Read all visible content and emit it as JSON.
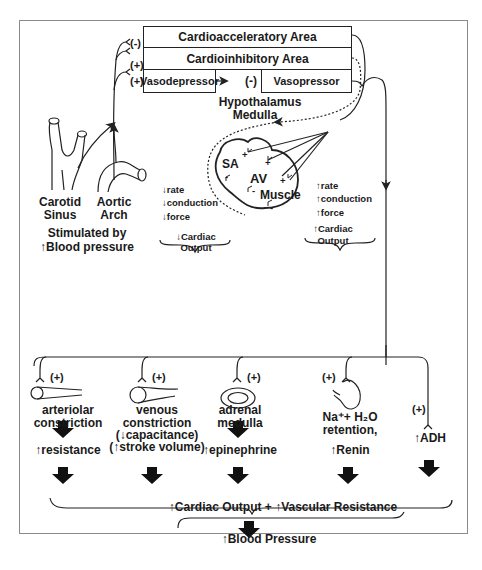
{
  "frame": {
    "border_color": "#8a8a8a",
    "line_color": "#222222"
  },
  "cns": {
    "boxes": {
      "cardioacceleratory": "Cardioacceleratory Area",
      "cardioinhibitory": "Cardioinhibitory Area",
      "vasodepressor": "Vasodepressor",
      "vasopressor": "Vasopressor"
    },
    "signs": {
      "cardioacceleratory": "(-)",
      "cardioinhibitory": "(+)",
      "vasodepressor": "(+)",
      "vasopressor": "(-)"
    },
    "label_line1": "Hypothalamus",
    "label_line2": "Medulla"
  },
  "receptors": {
    "carotid_line1": "Carotid",
    "carotid_line2": "Sinus",
    "aortic_line1": "Aortic",
    "aortic_line2": "Arch",
    "stimulated_line1": "Stimulated by",
    "stimulated_line2": "↑Blood pressure"
  },
  "heart": {
    "sa": "SA",
    "av": "AV",
    "muscle": "Muscle",
    "plus": "+",
    "minus": "-"
  },
  "decrease_effects": {
    "items": [
      "↓rate",
      "↓conduction",
      "↓force"
    ],
    "result_line1": "↓Cardiac",
    "result_line2": "Output"
  },
  "increase_effects": {
    "items": [
      "↑rate",
      "↑conduction",
      "↑force"
    ],
    "result_line1": "↑Cardiac",
    "result_line2": "Output"
  },
  "peripheral": {
    "sign": "(+)",
    "columns": [
      {
        "title_line1": "arteriolar",
        "title_line2": "constriction",
        "result": "↑resistance"
      },
      {
        "title_line1": "venous",
        "title_line2": "constriction",
        "title_line3": "(↓capacitance)",
        "title_line4": "(↑stroke volume)"
      },
      {
        "title_line1": "adrenal",
        "title_line2": "medulla",
        "result": "↑epinephrine"
      },
      {
        "title_line1": "Na⁺+ H₂O",
        "title_line2": "retention,",
        "result": "↑Renin"
      },
      {
        "result": "↑ADH"
      }
    ]
  },
  "summary": {
    "combined": "↑Cardiac Output + ↑Vascular Resistance",
    "final": "↑Blood Pressure"
  }
}
